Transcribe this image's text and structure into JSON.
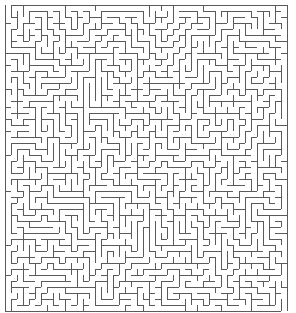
{
  "figure": {
    "type": "rectangular-perfect-maze"
  },
  "canvas": {
    "width": 296,
    "height": 313,
    "background_color": "#ffffff"
  },
  "maze": {
    "columns": 47,
    "rows": 51,
    "cell_size": 6,
    "origin_x": 5,
    "origin_y": 5,
    "wall_thickness": 1,
    "wall_color": "#5a5a5a",
    "passage_color": "#ffffff",
    "algorithm": "depth-first-search",
    "seed": 20240517,
    "entrance": {
      "label": "entrance",
      "side": "top",
      "column": 0
    },
    "exit": {
      "label": "exit",
      "side": "bottom",
      "column": 46
    },
    "clipped_bottom": true
  },
  "legend": {
    "entrance_label": "Start",
    "exit_label": "Finish"
  }
}
